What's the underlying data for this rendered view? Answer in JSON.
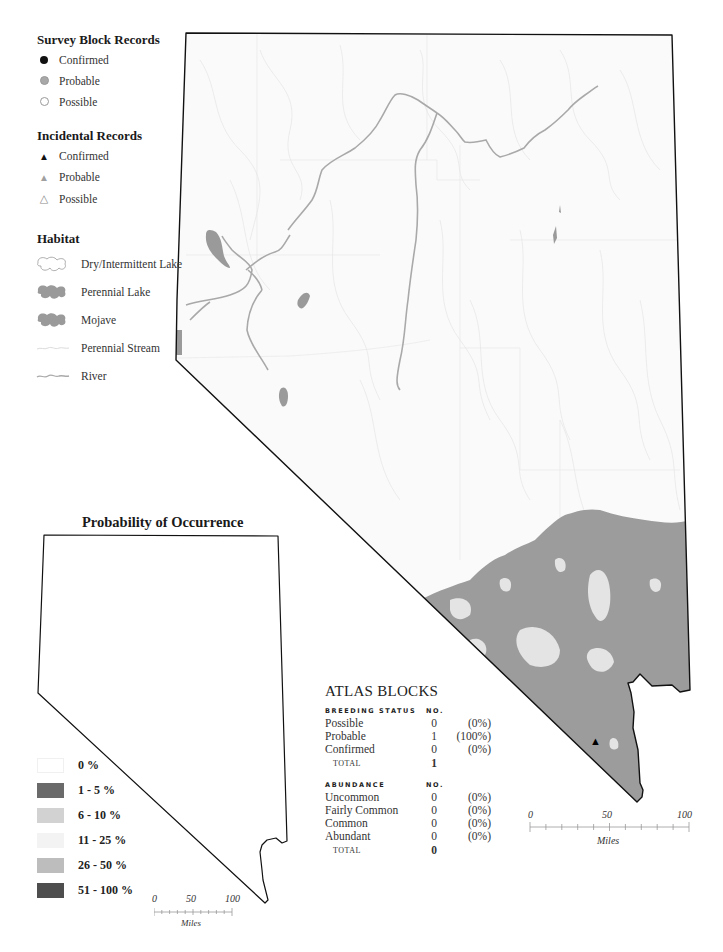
{
  "legend": {
    "survey_block": {
      "title": "Survey Block Records",
      "items": [
        {
          "label": "Confirmed",
          "symbol": "filled-circle",
          "color": "#111111"
        },
        {
          "label": "Probable",
          "symbol": "gray-circle",
          "color": "#a8a8a8"
        },
        {
          "label": "Possible",
          "symbol": "open-circle",
          "color": "#ffffff"
        }
      ]
    },
    "incidental": {
      "title": "Incidental Records",
      "items": [
        {
          "label": "Confirmed",
          "symbol": "filled-triangle",
          "glyph": "▲"
        },
        {
          "label": "Probable",
          "symbol": "gray-triangle",
          "glyph": "▲"
        },
        {
          "label": "Possible",
          "symbol": "open-triangle",
          "glyph": "△"
        }
      ]
    },
    "habitat": {
      "title": "Habitat",
      "items": [
        {
          "label": "Dry/Intermittent Lake",
          "symbol": "dry-lake"
        },
        {
          "label": "Perennial Lake",
          "symbol": "perennial-lake",
          "color": "#9a9a9a"
        },
        {
          "label": "Mojave",
          "symbol": "mojave",
          "color": "#9a9a9a"
        },
        {
          "label": "Perennial Stream",
          "symbol": "stream",
          "color": "#e0e0e0"
        },
        {
          "label": "River",
          "symbol": "river",
          "color": "#b0b0b0"
        }
      ]
    }
  },
  "probability": {
    "title": "Probability of Occurrence",
    "classes": [
      {
        "label": "0 %",
        "color": "#ffffff"
      },
      {
        "label": "1 - 5 %",
        "color": "#6a6a6a"
      },
      {
        "label": "6 - 10 %",
        "color": "#d2d2d2"
      },
      {
        "label": "11 - 25 %",
        "color": "#f3f3f3"
      },
      {
        "label": "26 - 50 %",
        "color": "#bdbdbd"
      },
      {
        "label": "51 - 100 %",
        "color": "#4e4e4e"
      }
    ],
    "scale": {
      "ticks": [
        "0",
        "50",
        "100"
      ],
      "unit": "Miles"
    }
  },
  "atlas_blocks": {
    "title": "ATLAS BLOCKS",
    "breeding": {
      "header": "BREEDING STATUS",
      "no_header": "NO.",
      "rows": [
        {
          "label": "Possible",
          "no": "0",
          "pct": "(0%)"
        },
        {
          "label": "Probable",
          "no": "1",
          "pct": "(100%)"
        },
        {
          "label": "Confirmed",
          "no": "0",
          "pct": "(0%)"
        }
      ],
      "total_label": "TOTAL",
      "total": "1"
    },
    "abundance": {
      "header": "ABUNDANCE",
      "no_header": "NO.",
      "rows": [
        {
          "label": "Uncommon",
          "no": "0",
          "pct": "(0%)"
        },
        {
          "label": "Fairly Common",
          "no": "0",
          "pct": "(0%)"
        },
        {
          "label": "Common",
          "no": "0",
          "pct": "(0%)"
        },
        {
          "label": "Abundant",
          "no": "0",
          "pct": "(0%)"
        }
      ],
      "total_label": "TOTAL",
      "total": "0"
    }
  },
  "main_map": {
    "mojave_color": "#9c9c9c",
    "border_color": "#111111",
    "record_marker": {
      "type": "incidental-confirmed",
      "glyph": "▲"
    },
    "scale": {
      "ticks": [
        "0",
        "50",
        "100"
      ],
      "unit": "Miles"
    }
  }
}
